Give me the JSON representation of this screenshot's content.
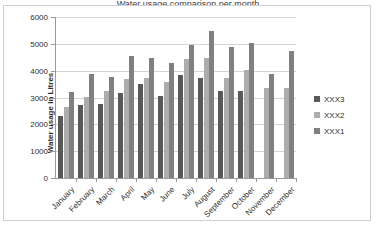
{
  "title_fragment": "Water usage comparison per month",
  "chart_data": {
    "type": "bar",
    "title": "",
    "xlabel": "",
    "ylabel": "Water usage in Litres",
    "ylim": [
      0,
      6000
    ],
    "yticks": [
      0,
      1000,
      2000,
      3000,
      4000,
      5000,
      6000
    ],
    "ytick_labels": [
      "0",
      "1000",
      "2000",
      "3000",
      "4000",
      "5000",
      "6000"
    ],
    "grid": true,
    "legend_position": "right",
    "categories": [
      "January",
      "February",
      "March",
      "April",
      "May",
      "June",
      "July",
      "August",
      "September",
      "October",
      "November",
      "December"
    ],
    "series": [
      {
        "name": "XXX3",
        "color": "#595959",
        "values": [
          2300,
          2720,
          2740,
          3150,
          3490,
          3060,
          3840,
          3720,
          3250,
          3250,
          null,
          null
        ]
      },
      {
        "name": "XXX2",
        "color": "#adadad",
        "values": [
          2650,
          3020,
          3250,
          3680,
          3710,
          3590,
          4450,
          4470,
          3720,
          4020,
          3350,
          3360
        ]
      },
      {
        "name": "XXX1",
        "color": "#808080",
        "values": [
          3220,
          3890,
          3780,
          4560,
          4490,
          4280,
          4940,
          5480,
          4890,
          5040,
          3890,
          4720
        ]
      }
    ]
  },
  "legend": {
    "items": [
      {
        "label": "XXX3",
        "color": "#595959"
      },
      {
        "label": "XXX2",
        "color": "#adadad"
      },
      {
        "label": "XXX1",
        "color": "#808080"
      }
    ]
  },
  "colors": {
    "grid": "#d4d4d4",
    "axis": "#9a9a9a",
    "frame_border": "#cfcfcf",
    "text": "#2f2f2f",
    "background": "#ffffff"
  }
}
